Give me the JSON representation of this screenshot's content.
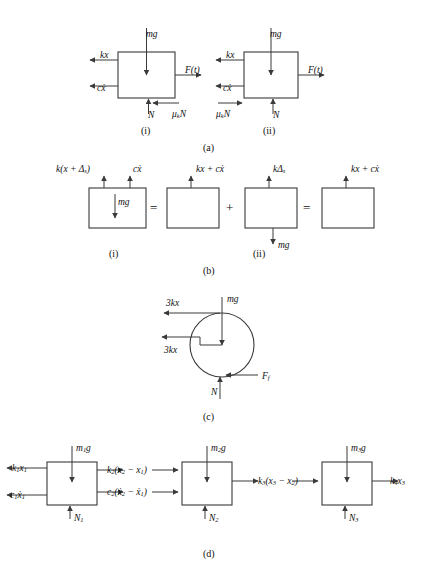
{
  "figure": {
    "background_color": "#ffffff",
    "line_color": "#3a3a3a",
    "text_color": "#111111"
  },
  "panels": [
    {
      "id": "a",
      "tag": "(a)",
      "x": 209,
      "y": 147
    },
    {
      "id": "b",
      "tag": "(b)",
      "x": 209,
      "y": 270
    },
    {
      "id": "c",
      "tag": "(c)",
      "x": 209,
      "y": 416
    },
    {
      "id": "d",
      "tag": "(d)",
      "x": 209,
      "y": 553
    }
  ],
  "subtags": [
    {
      "id": "a-i",
      "tag": "(i)",
      "x": 145,
      "y": 130
    },
    {
      "id": "a-ii",
      "tag": "(ii)",
      "x": 268,
      "y": 130
    },
    {
      "id": "b-i",
      "tag": "(i)",
      "x": 113,
      "y": 253
    },
    {
      "id": "b-ii",
      "tag": "(ii)",
      "x": 257,
      "y": 253
    }
  ],
  "panel_a": {
    "diagram_i": {
      "box": {
        "x": 118,
        "y": 52,
        "w": 57,
        "h": 46
      },
      "forces": [
        {
          "name": "weight",
          "label_html": "mg",
          "direction": "down",
          "lx": 146,
          "ly": 30
        },
        {
          "name": "spring-force",
          "label_html": "kx",
          "direction": "left",
          "lx": 100,
          "ly": 58
        },
        {
          "name": "damping-force",
          "label_html": "c<span class=\"ital\">ẋ</span>",
          "direction": "left",
          "lx": 97,
          "ly": 85
        },
        {
          "name": "applied-force",
          "label_html": "F(t)",
          "direction": "right",
          "lx": 185,
          "ly": 71
        },
        {
          "name": "normal-force",
          "label_html": "N",
          "direction": "up",
          "lx": 148,
          "ly": 112
        },
        {
          "name": "friction-force",
          "label_html": "&mu;<sub>k</sub>N",
          "direction": "left",
          "lx": 172,
          "ly": 112
        }
      ]
    },
    "diagram_ii": {
      "box": {
        "x": 244,
        "y": 52,
        "w": 54,
        "h": 46
      },
      "forces": [
        {
          "name": "weight",
          "label_html": "mg",
          "direction": "down",
          "lx": 270,
          "ly": 30
        },
        {
          "name": "spring-force",
          "label_html": "kx",
          "direction": "left",
          "lx": 226,
          "ly": 58
        },
        {
          "name": "damping-force",
          "label_html": "c<span class=\"ital\">ẋ</span>",
          "direction": "left",
          "lx": 223,
          "ly": 85
        },
        {
          "name": "applied-force",
          "label_html": "F(t)",
          "direction": "right",
          "lx": 308,
          "ly": 71
        },
        {
          "name": "normal-force",
          "label_html": "N",
          "direction": "up",
          "lx": 273,
          "ly": 112
        },
        {
          "name": "friction-force",
          "label_html": "&mu;<sub>k</sub>N",
          "direction": "right",
          "lx": 222,
          "ly": 112
        }
      ]
    }
  },
  "panel_b": {
    "operators": [
      {
        "symbol": "=",
        "x": 152,
        "y": 200
      },
      {
        "symbol": "+",
        "x": 228,
        "y": 200
      },
      {
        "symbol": "=",
        "x": 305,
        "y": 200
      }
    ],
    "boxes": [
      {
        "name": "static-plus-dynamic",
        "box": {
          "x": 89,
          "y": 188,
          "w": 57,
          "h": 40
        },
        "up_labels": [
          {
            "label_html": "k(x + &Delta;<sub>s</sub>)",
            "lx": 60,
            "ly": 169,
            "arrow_x": 104
          },
          {
            "label_html": "c<span class=\"ital\">ẋ</span>",
            "lx": 133,
            "ly": 169,
            "arrow_x": 130
          }
        ],
        "inner_label": {
          "label_html": "mg",
          "lx": 118,
          "ly": 200,
          "direction": "down"
        }
      },
      {
        "name": "dynamic-only",
        "box": {
          "x": 167,
          "y": 188,
          "w": 52,
          "h": 40
        },
        "up_labels": [
          {
            "label_html": "kx + c<span class=\"ital\">ẋ</span>",
            "lx": 196,
            "ly": 169,
            "arrow_x": 191
          }
        ],
        "inner_label": null
      },
      {
        "name": "static-equilibrium",
        "box": {
          "x": 245,
          "y": 188,
          "w": 52,
          "h": 40
        },
        "up_labels": [
          {
            "label_html": "k&Delta;<sub>s</sub>",
            "lx": 273,
            "ly": 169,
            "arrow_x": 269
          }
        ],
        "below_label": {
          "label_html": "mg",
          "lx": 278,
          "ly": 243,
          "direction": "down"
        }
      },
      {
        "name": "net-dynamic",
        "box": {
          "x": 322,
          "y": 188,
          "w": 52,
          "h": 40
        },
        "up_labels": [
          {
            "label_html": "kx + c<span class=\"ital\">ẋ</span>",
            "lx": 351,
            "ly": 169,
            "arrow_x": 346
          }
        ],
        "inner_label": null
      }
    ]
  },
  "panel_c": {
    "circle": {
      "cx": 222,
      "cy": 345,
      "r": 32
    },
    "forces": [
      {
        "name": "spring-force-top",
        "label_html": "3kx",
        "direction": "left",
        "lx": 168,
        "ly": 305
      },
      {
        "name": "weight",
        "label_html": "mg",
        "direction": "down",
        "lx": 227,
        "ly": 296
      },
      {
        "name": "spring-force-mid",
        "label_html": "3kx",
        "direction": "left",
        "lx": 166,
        "ly": 348
      },
      {
        "name": "normal-force",
        "label_html": "N",
        "direction": "up",
        "lx": 211,
        "ly": 390
      },
      {
        "name": "friction-force",
        "label_html": "F<sub>f</sub>",
        "direction": "left",
        "lx": 262,
        "ly": 380
      }
    ]
  },
  "panel_d": {
    "masses": [
      {
        "name": "mass-1",
        "box": {
          "x": 47,
          "y": 462,
          "w": 50,
          "h": 43
        },
        "weight": {
          "label_html": "m<sub>1</sub>g",
          "lx": 76,
          "ly": 446
        },
        "normal": {
          "label_html": "N<sub>1</sub>",
          "lx": 74,
          "ly": 516
        },
        "left_forces": [
          {
            "label_html": "k<sub>1</sub>x<sub>1</sub>",
            "lx": 12,
            "ly": 468
          },
          {
            "label_html": "c<sub>1</sub><span class=\"ital\">ẋ</span><sub>1</sub>",
            "lx": 10,
            "ly": 495
          }
        ],
        "right_forces": [
          {
            "label_html": "k<sub>2</sub>(x<sub>2</sub> &minus; x<sub>1</sub>)",
            "lx": 107,
            "ly": 470
          },
          {
            "label_html": "c<sub>2</sub>(<span class=\"ital\">ẋ</span><sub>2</sub> &minus; <span class=\"ital\">ẋ</span><sub>1</sub>)",
            "lx": 107,
            "ly": 492
          }
        ]
      },
      {
        "name": "mass-2",
        "box": {
          "x": 182,
          "y": 462,
          "w": 50,
          "h": 43
        },
        "weight": {
          "label_html": "m<sub>2</sub>g",
          "lx": 211,
          "ly": 446
        },
        "normal": {
          "label_html": "N<sub>2</sub>",
          "lx": 209,
          "ly": 516
        },
        "right_forces": [
          {
            "label_html": "k<sub>3</sub>(x<sub>3</sub> &minus; x<sub>2</sub>)",
            "lx": 258,
            "ly": 481
          }
        ]
      },
      {
        "name": "mass-3",
        "box": {
          "x": 322,
          "y": 462,
          "w": 50,
          "h": 43
        },
        "weight": {
          "label_html": "m<sub>3</sub>g",
          "lx": 351,
          "ly": 446
        },
        "normal": {
          "label_html": "N<sub>3</sub>",
          "lx": 349,
          "ly": 516
        },
        "right_forces": [
          {
            "label_html": "k<sub>4</sub>x<sub>3</sub>",
            "lx": 390,
            "ly": 481
          }
        ]
      }
    ]
  }
}
